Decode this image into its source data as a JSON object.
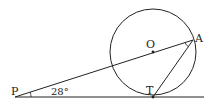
{
  "diagram": {
    "points": {
      "P": {
        "label": "P",
        "x": 15,
        "y": 97
      },
      "O": {
        "label": "O",
        "x": 153,
        "y": 52
      },
      "A": {
        "label": "A",
        "x": 193,
        "y": 40
      },
      "T": {
        "label": "T",
        "x": 153,
        "y": 97
      }
    },
    "circle": {
      "center": "O",
      "radius": 43
    },
    "angle_label": "28°",
    "stroke_color": "#222222"
  }
}
